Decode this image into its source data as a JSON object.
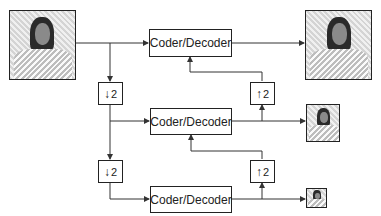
{
  "diagram": {
    "levels": [
      {
        "coder_label": "Coder/Decoder",
        "input": "full-resolution image",
        "output": "full-resolution reconstructed image"
      },
      {
        "coder_label": "Coder/Decoder",
        "downsample_label": "2",
        "upsample_label": "2",
        "output": "half-resolution image"
      },
      {
        "coder_label": "Coder/Decoder",
        "downsample_label": "2",
        "upsample_label": "2",
        "output": "quarter-resolution image"
      }
    ],
    "down_arrow": "↓",
    "up_arrow": "↑",
    "colors": {
      "line": "#333333",
      "box_border": "#222222",
      "background": "#ffffff"
    }
  }
}
